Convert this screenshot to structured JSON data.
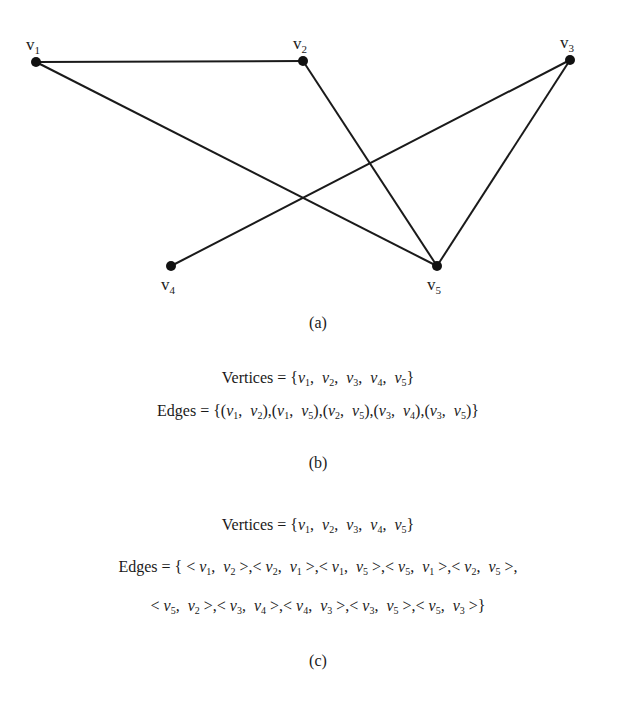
{
  "graph": {
    "vertices": [
      {
        "id": "v1",
        "label": "v",
        "sub": "1",
        "x": 36,
        "y": 62
      },
      {
        "id": "v2",
        "label": "v",
        "sub": "2",
        "x": 303,
        "y": 61
      },
      {
        "id": "v3",
        "label": "v",
        "sub": "3",
        "x": 570,
        "y": 60
      },
      {
        "id": "v4",
        "label": "v",
        "sub": "4",
        "x": 171,
        "y": 266
      },
      {
        "id": "v5",
        "label": "v",
        "sub": "5",
        "x": 437,
        "y": 266
      }
    ],
    "edges": [
      [
        "v1",
        "v2"
      ],
      [
        "v1",
        "v5"
      ],
      [
        "v2",
        "v5"
      ],
      [
        "v3",
        "v4"
      ],
      [
        "v3",
        "v5"
      ]
    ],
    "colors": {
      "stroke": "#1a1a1a",
      "node": "#111111"
    }
  },
  "captions": {
    "a": "(a)",
    "b": "(b)",
    "c": "(c)"
  },
  "part_b": {
    "vertices_label": "Vertices = ",
    "vertices": [
      "1",
      "2",
      "3",
      "4",
      "5"
    ],
    "edges_label": "Edges = ",
    "edges": [
      [
        "1",
        "2"
      ],
      [
        "1",
        "5"
      ],
      [
        "2",
        "5"
      ],
      [
        "3",
        "4"
      ],
      [
        "3",
        "5"
      ]
    ]
  },
  "part_c": {
    "vertices_label": "Vertices = ",
    "vertices": [
      "1",
      "2",
      "3",
      "4",
      "5"
    ],
    "edges_label": "Edges = ",
    "edges_line1": [
      [
        "1",
        "2"
      ],
      [
        "2",
        "1"
      ],
      [
        "1",
        "5"
      ],
      [
        "5",
        "1"
      ],
      [
        "2",
        "5"
      ]
    ],
    "edges_line2": [
      [
        "5",
        "2"
      ],
      [
        "3",
        "4"
      ],
      [
        "4",
        "3"
      ],
      [
        "3",
        "5"
      ],
      [
        "5",
        "3"
      ]
    ]
  }
}
